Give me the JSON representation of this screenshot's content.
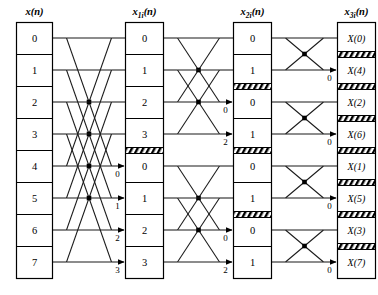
{
  "diagram": {
    "type": "fft-butterfly-flowgraph",
    "points": 8,
    "stages": 3,
    "columns": [
      {
        "id": "col-input",
        "header": "x(n)",
        "header_base": "x",
        "header_sub": "",
        "header_tail": "(n)",
        "cells": [
          "0",
          "1",
          "2",
          "3",
          "4",
          "5",
          "6",
          "7"
        ],
        "separators": [],
        "arrow_labels": []
      },
      {
        "id": "col-stage1",
        "header": "x1i(n)",
        "header_base": "x",
        "header_sub": "1i",
        "header_tail": "(n)",
        "cells": [
          "0",
          "1",
          "2",
          "3",
          "0",
          "1",
          "2",
          "3"
        ],
        "separators": [
          4
        ],
        "arrow_labels": [
          {
            "index": 4,
            "text": "0"
          },
          {
            "index": 5,
            "text": "1"
          },
          {
            "index": 6,
            "text": "2"
          },
          {
            "index": 7,
            "text": "3"
          }
        ]
      },
      {
        "id": "col-stage2",
        "header": "x2i(n)",
        "header_base": "x",
        "header_sub": "2i",
        "header_tail": "(n)",
        "cells": [
          "0",
          "1",
          "0",
          "1",
          "0",
          "1",
          "0",
          "1"
        ],
        "separators": [
          2,
          4,
          6
        ],
        "arrow_labels": [
          {
            "index": 2,
            "text": "0"
          },
          {
            "index": 3,
            "text": "2"
          },
          {
            "index": 6,
            "text": "0"
          },
          {
            "index": 7,
            "text": "2"
          }
        ]
      },
      {
        "id": "col-output",
        "header": "x3i(n)",
        "header_base": "x",
        "header_sub": "3i",
        "header_tail": "(n)",
        "cells": [
          "X(0)",
          "X(4)",
          "X(2)",
          "X(6)",
          "X(1)",
          "X(5)",
          "X(3)",
          "X(7)"
        ],
        "separators": [
          1,
          2,
          3,
          4,
          5,
          6,
          7
        ],
        "arrow_labels": [
          {
            "index": 1,
            "text": "0"
          },
          {
            "index": 3,
            "text": "0"
          },
          {
            "index": 5,
            "text": "0"
          },
          {
            "index": 7,
            "text": "0"
          }
        ]
      }
    ],
    "stage_wiring": [
      {
        "name": "stage-1",
        "span": 4,
        "pairs": [
          [
            0,
            4
          ],
          [
            1,
            5
          ],
          [
            2,
            6
          ],
          [
            3,
            7
          ]
        ],
        "twiddle_labels": [
          "0",
          "1",
          "2",
          "3"
        ]
      },
      {
        "name": "stage-2",
        "span": 2,
        "pairs": [
          [
            0,
            2
          ],
          [
            1,
            3
          ],
          [
            4,
            6
          ],
          [
            5,
            7
          ]
        ],
        "twiddle_labels": [
          "0",
          "2",
          "0",
          "2"
        ]
      },
      {
        "name": "stage-3",
        "span": 1,
        "pairs": [
          [
            0,
            1
          ],
          [
            2,
            3
          ],
          [
            4,
            5
          ],
          [
            6,
            7
          ]
        ],
        "twiddle_labels": [
          "0",
          "0",
          "0",
          "0"
        ]
      }
    ],
    "colors": {
      "line": "#1a1a1a",
      "text": "#000000",
      "background": "#ffffff",
      "hatch": "#000000"
    }
  }
}
